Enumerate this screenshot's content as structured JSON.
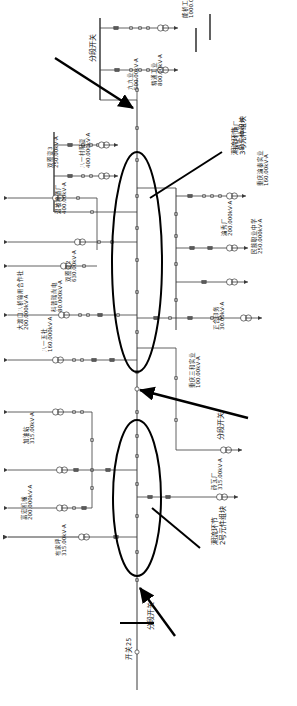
{
  "figure": {
    "orientation": "rotated-90",
    "line_color": "#3a3a3a",
    "annotation_color": "#000000",
    "ellipse_color": "#000000"
  },
  "annotations": [
    {
      "id": "ann-top",
      "text": "分段开关",
      "x": 90,
      "y": 62
    },
    {
      "id": "ann-block3",
      "text": "潮流环节\n3号元件组块",
      "x": 232,
      "y": 155
    },
    {
      "id": "ann-mid",
      "text": "分段开关",
      "x": 218,
      "y": 440
    },
    {
      "id": "ann-block2",
      "text": "潮流环节\n2号元件组块",
      "x": 212,
      "y": 545
    },
    {
      "id": "ann-bottom",
      "text": "分段开关",
      "x": 148,
      "y": 630
    }
  ],
  "loads": [
    {
      "id": "l01",
      "name": "能桥工",
      "capacity": "1000.0kV·A",
      "x": 183,
      "y": 18
    },
    {
      "id": "l02",
      "name": "精通工业",
      "capacity": "800.00kV·A",
      "x": 152,
      "y": 86
    },
    {
      "id": "l03",
      "name": "九九业",
      "capacity": "500.00kV·A",
      "x": 128,
      "y": 90
    },
    {
      "id": "l04",
      "name": "双圈变3",
      "capacity": "250.00kV·A",
      "x": 48,
      "y": 168
    },
    {
      "id": "l05",
      "name": "八一村阳变",
      "capacity": "400.000kV·A",
      "x": 80,
      "y": 168
    },
    {
      "id": "l06",
      "name": "温被啤酒厂",
      "capacity": "400.00kV·A",
      "x": 56,
      "y": 214
    },
    {
      "id": "l07",
      "name": "双圈变2",
      "capacity": "630.00kV·A",
      "x": 66,
      "y": 282
    },
    {
      "id": "l08",
      "name": "科普瑞尚电",
      "capacity": "80.000kV·A",
      "x": 52,
      "y": 312
    },
    {
      "id": "l09",
      "name": "大渡口八桥输用合作社",
      "capacity": "200.000kV·A",
      "x": 18,
      "y": 330
    },
    {
      "id": "l10",
      "name": "八一五社",
      "capacity": "160.000kV·A",
      "x": 42,
      "y": 352
    },
    {
      "id": "l11",
      "name": "加油站",
      "capacity": "315.00kV·A",
      "x": 24,
      "y": 444
    },
    {
      "id": "l12",
      "name": "富宏机械",
      "capacity": "200.000kV·A",
      "x": 22,
      "y": 520
    },
    {
      "id": "l13",
      "name": "布家坪",
      "capacity": "315.00kV·A",
      "x": 56,
      "y": 556
    },
    {
      "id": "l14",
      "name": "长江机电厂",
      "capacity": "315.00kV·A",
      "x": 234,
      "y": 150
    },
    {
      "id": "l15",
      "name": "重庆渝秦实业",
      "capacity": "160.00kV·A",
      "x": 258,
      "y": 186
    },
    {
      "id": "l16",
      "name": "渝秀厂",
      "capacity": "200.000kV·A",
      "x": 222,
      "y": 236
    },
    {
      "id": "l17",
      "name": "民族职业中学",
      "capacity": "250.000kV·A",
      "x": 252,
      "y": 254
    },
    {
      "id": "l18",
      "name": "正合印务",
      "capacity": "30.00kV·A",
      "x": 214,
      "y": 330
    },
    {
      "id": "l19",
      "name": "重庆三和实业",
      "capacity": "100.00kV·A",
      "x": 190,
      "y": 388
    },
    {
      "id": "l20",
      "name": "砖瓦厂",
      "capacity": "315.00kV·A",
      "x": 212,
      "y": 490
    }
  ],
  "feeders": [
    {
      "id": "f-main-top",
      "label": "主干线上段"
    },
    {
      "id": "f-main-bottom",
      "label": "主干线下段"
    },
    {
      "id": "f-sw25",
      "label": "开关25",
      "x": 126,
      "y": 660
    }
  ],
  "legend": {
    "transformer_symbol": "circle-pair",
    "switch_symbol": "square",
    "breaker_symbol": "bar",
    "arrow_symbol": "load-arrow"
  }
}
